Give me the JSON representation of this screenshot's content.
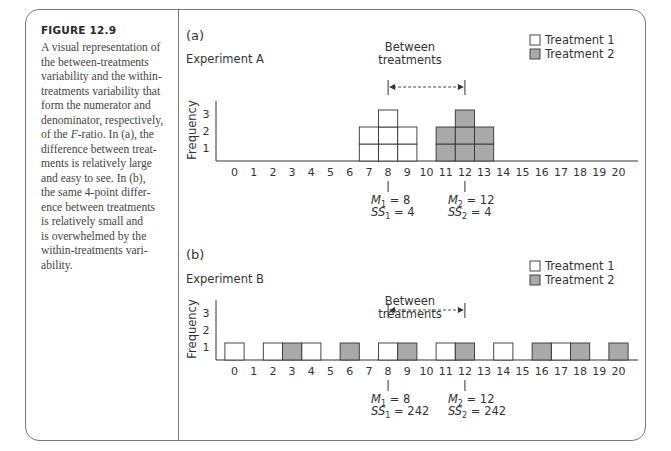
{
  "figure": {
    "label": "FIGURE 12.9",
    "caption_lines": [
      "A visual representation of",
      "the between-treatments",
      "variability and the within-",
      "treatments variability that",
      "form the numerator and",
      "denominator, respectively,",
      "of the F-ratio. In (a), the",
      "difference between treat-",
      "ments is relatively large",
      "and easy to see. In (b),",
      "the same 4-point differ-",
      "ence between treatments",
      "is relatively small and",
      "is overwhelmed by the",
      "within-treatments vari-",
      "ability."
    ]
  },
  "colors": {
    "treatment1_fill": "#ffffff",
    "treatment2_fill": "#a9a9a9",
    "stroke": "#333333",
    "frame": "#777777"
  },
  "panels": {
    "a": {
      "panel_label": "(a)",
      "experiment": "Experiment A",
      "ylabel": "Frequency",
      "yticks": [
        "1",
        "2",
        "3"
      ],
      "between_label_1": "Between",
      "between_label_2": "treatments",
      "legend": [
        "Treatment 1",
        "Treatment 2"
      ],
      "m1": "M1 = 8",
      "m1_sym": "M",
      "m1_sub": "1",
      "m1_val": " = 8",
      "ss1_sym": "SS",
      "ss1_sub": "1",
      "ss1_val": " = 4",
      "m2_sym": "M",
      "m2_sub": "2",
      "m2_val": " = 12",
      "ss2_sym": "SS",
      "ss2_sub": "2",
      "ss2_val": " = 4"
    },
    "b": {
      "panel_label": "(b)",
      "experiment": "Experiment B",
      "ylabel": "Frequency",
      "yticks": [
        "1",
        "2",
        "3"
      ],
      "between_label_1": "Between",
      "between_label_2": "treatments",
      "legend": [
        "Treatment 1",
        "Treatment 2"
      ],
      "m1_sym": "M",
      "m1_sub": "1",
      "m1_val": " = 8",
      "ss1_sym": "SS",
      "ss1_sub": "1",
      "ss1_val": " = 242",
      "m2_sym": "M",
      "m2_sub": "2",
      "m2_val": " = 12",
      "ss2_sym": "SS",
      "ss2_sub": "2",
      "ss2_val": " = 242"
    }
  },
  "chart_data": [
    {
      "type": "bar",
      "title": "Experiment A",
      "xlabel": "",
      "ylabel": "Frequency",
      "categories": [
        0,
        1,
        2,
        3,
        4,
        5,
        6,
        7,
        8,
        9,
        10,
        11,
        12,
        13,
        14,
        15,
        16,
        17,
        18,
        19,
        20
      ],
      "series": [
        {
          "name": "Treatment 1",
          "values": [
            0,
            0,
            0,
            0,
            0,
            0,
            0,
            2,
            3,
            2,
            0,
            0,
            0,
            0,
            0,
            0,
            0,
            0,
            0,
            0,
            0
          ]
        },
        {
          "name": "Treatment 2",
          "values": [
            0,
            0,
            0,
            0,
            0,
            0,
            0,
            0,
            0,
            0,
            0,
            2,
            3,
            2,
            0,
            0,
            0,
            0,
            0,
            0,
            0
          ]
        }
      ],
      "ylim": [
        0,
        3
      ],
      "grid": false,
      "legend_position": "top-right",
      "annotations": [
        "Between treatments (8 to 12)",
        "M1 = 8",
        "SS1 = 4",
        "M2 = 12",
        "SS2 = 4"
      ]
    },
    {
      "type": "bar",
      "title": "Experiment B",
      "xlabel": "",
      "ylabel": "Frequency",
      "categories": [
        0,
        1,
        2,
        3,
        4,
        5,
        6,
        7,
        8,
        9,
        10,
        11,
        12,
        13,
        14,
        15,
        16,
        17,
        18,
        19,
        20
      ],
      "series": [
        {
          "name": "Treatment 1",
          "values": [
            1,
            0,
            1,
            0,
            1,
            0,
            0,
            0,
            1,
            0,
            0,
            1,
            0,
            0,
            1,
            0,
            0,
            1,
            0,
            0,
            0
          ]
        },
        {
          "name": "Treatment 2",
          "values": [
            0,
            0,
            0,
            1,
            0,
            0,
            1,
            0,
            0,
            1,
            0,
            0,
            1,
            0,
            0,
            0,
            1,
            0,
            1,
            0,
            1
          ]
        }
      ],
      "ylim": [
        0,
        3
      ],
      "grid": false,
      "legend_position": "top-right",
      "annotations": [
        "Between treatments (8 to 12)",
        "M1 = 8",
        "SS1 = 242",
        "M2 = 12",
        "SS2 = 242"
      ]
    }
  ]
}
